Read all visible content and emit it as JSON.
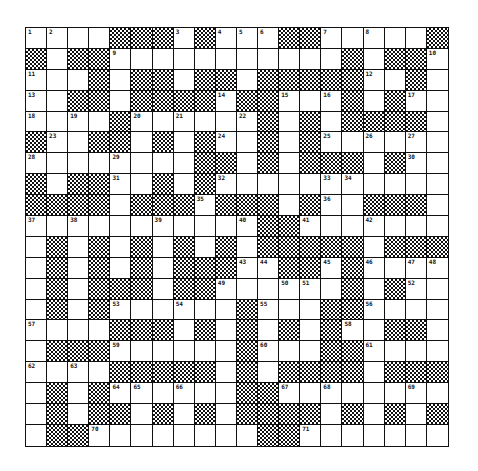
{
  "puzzle": {
    "rows": 20,
    "cols": 20,
    "grid": [
      [
        "1",
        "2",
        ".",
        ".",
        "#",
        "#",
        "#",
        "3",
        "#",
        "4",
        "5",
        "6",
        "#",
        "#",
        "7",
        ".",
        "8",
        ".",
        ".",
        "#"
      ],
      [
        "#",
        ".",
        "#",
        "#",
        "9",
        ".",
        ".",
        ".",
        ".",
        ".",
        ".",
        ".",
        ".",
        ".",
        ".",
        "#",
        ".",
        "#",
        "#",
        "10"
      ],
      [
        "11",
        ".",
        ".",
        "#",
        ".",
        "#",
        "#",
        ".",
        "#",
        "#",
        ".",
        "#",
        "#",
        "#",
        "#",
        "#",
        "12",
        ".",
        "#",
        "."
      ],
      [
        "13",
        ".",
        "#",
        "#",
        ".",
        "#",
        "#",
        "#",
        "#",
        "14",
        "#",
        "#",
        "15",
        ".",
        "16",
        "#",
        ".",
        "#",
        "17",
        "."
      ],
      [
        "18",
        ".",
        "19",
        ".",
        "#",
        "20",
        ".",
        "21",
        ".",
        ".",
        "22",
        "#",
        ".",
        "#",
        ".",
        "#",
        "#",
        "#",
        "#",
        "."
      ],
      [
        "#",
        "23",
        ".",
        "#",
        "#",
        ".",
        "#",
        ".",
        "#",
        "24",
        ".",
        "#",
        ".",
        "#",
        "25",
        ".",
        "26",
        ".",
        "27",
        "."
      ],
      [
        "28",
        ".",
        ".",
        ".",
        "29",
        ".",
        ".",
        ".",
        "#",
        "#",
        ".",
        "#",
        ".",
        "#",
        "#",
        "#",
        ".",
        "#",
        "30",
        "."
      ],
      [
        "#",
        ".",
        "#",
        "#",
        "31",
        ".",
        "#",
        ".",
        "#",
        "32",
        ".",
        ".",
        ".",
        ".",
        "33",
        "34",
        ".",
        ".",
        ".",
        "."
      ],
      [
        "#",
        "#",
        "#",
        "#",
        ".",
        "#",
        "#",
        "#",
        "35",
        "#",
        "#",
        "#",
        ".",
        "#",
        "36",
        ".",
        "#",
        "#",
        "#",
        "."
      ],
      [
        "37",
        ".",
        "38",
        ".",
        ".",
        ".",
        "39",
        ".",
        ".",
        ".",
        "40",
        "#",
        "#",
        "41",
        ".",
        ".",
        "42",
        ".",
        ".",
        "."
      ],
      [
        ".",
        "#",
        ".",
        "#",
        ".",
        "#",
        ".",
        "#",
        ".",
        "#",
        ".",
        "#",
        "#",
        "#",
        "#",
        "#",
        ".",
        "#",
        "#",
        "#"
      ],
      [
        ".",
        "#",
        ".",
        "#",
        ".",
        "#",
        ".",
        "#",
        "#",
        "#",
        "43",
        "44",
        "#",
        "#",
        "45",
        "#",
        "46",
        ".",
        "47",
        "48"
      ],
      [
        ".",
        "#",
        ".",
        "#",
        "#",
        "#",
        ".",
        "#",
        "#",
        "49",
        ".",
        ".",
        "50",
        "51",
        ".",
        "#",
        ".",
        "#",
        "52",
        "."
      ],
      [
        ".",
        "#",
        ".",
        "#",
        "53",
        ".",
        ".",
        "54",
        ".",
        ".",
        "#",
        "55",
        ".",
        ".",
        "#",
        "#",
        "56",
        ".",
        ".",
        "."
      ],
      [
        "57",
        ".",
        ".",
        ".",
        "#",
        "#",
        "#",
        ".",
        "#",
        ".",
        "#",
        ".",
        "#",
        ".",
        "#",
        "58",
        ".",
        "#",
        "#",
        "."
      ],
      [
        ".",
        "#",
        "#",
        "#",
        "59",
        ".",
        ".",
        ".",
        ".",
        ".",
        "#",
        "60",
        ".",
        ".",
        "#",
        "#",
        "61",
        ".",
        ".",
        "."
      ],
      [
        "62",
        ".",
        "63",
        ".",
        "#",
        "#",
        "#",
        "#",
        "#",
        ".",
        "#",
        ".",
        "#",
        "#",
        "#",
        "#",
        ".",
        "#",
        "#",
        "#"
      ],
      [
        ".",
        "#",
        ".",
        "#",
        "64",
        "65",
        ".",
        "66",
        ".",
        ".",
        "#",
        "#",
        "67",
        ".",
        "68",
        ".",
        ".",
        ".",
        "69",
        "."
      ],
      [
        ".",
        "#",
        ".",
        "#",
        "#",
        ".",
        "#",
        ".",
        "#",
        ".",
        "#",
        "#",
        "#",
        "#",
        ".",
        "#",
        ".",
        "#",
        ".",
        "#"
      ],
      [
        ".",
        "#",
        "#",
        "70",
        ".",
        ".",
        ".",
        ".",
        ".",
        ".",
        ".",
        "#",
        "#",
        "71",
        ".",
        ".",
        ".",
        ".",
        ".",
        "."
      ]
    ]
  },
  "colors": {
    "line": "#111111",
    "white_cell": "#ffffff",
    "black_cell_pattern": "checkerboard"
  }
}
